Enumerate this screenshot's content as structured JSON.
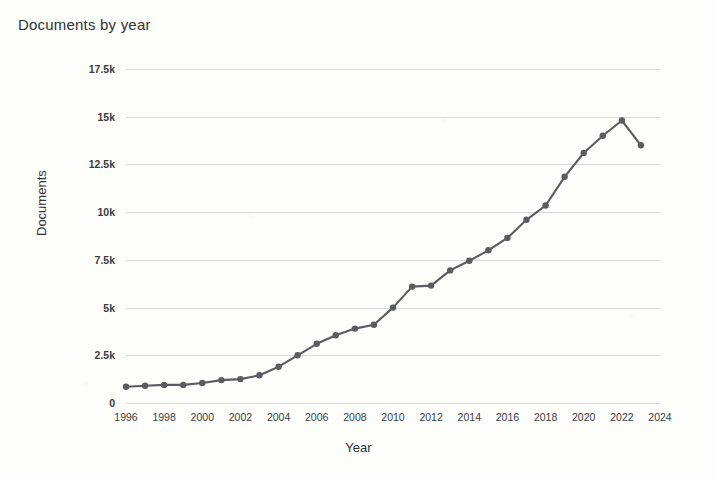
{
  "chart_data": {
    "type": "line",
    "title": "Documents by year",
    "xlabel": "Year",
    "ylabel": "Documents",
    "grid": true,
    "legend": "none",
    "xlim": [
      1996,
      2024
    ],
    "ylim": [
      0,
      17500
    ],
    "ytick_labels": [
      "0",
      "2.5k",
      "5k",
      "7.5k",
      "10k",
      "12.5k",
      "15k",
      "17.5k"
    ],
    "ytick_values": [
      0,
      2500,
      5000,
      7500,
      10000,
      12500,
      15000,
      17500
    ],
    "xtick_labels": [
      "1996",
      "1998",
      "2000",
      "2002",
      "2004",
      "2006",
      "2008",
      "2010",
      "2012",
      "2014",
      "2016",
      "2018",
      "2020",
      "2022",
      "2024"
    ],
    "xtick_values": [
      1996,
      1998,
      2000,
      2002,
      2004,
      2006,
      2008,
      2010,
      2012,
      2014,
      2016,
      2018,
      2020,
      2022,
      2024
    ],
    "series": [
      {
        "name": "Documents",
        "color": "#5a5c60",
        "x": [
          1996,
          1997,
          1998,
          1999,
          2000,
          2001,
          2002,
          2003,
          2004,
          2005,
          2006,
          2007,
          2008,
          2009,
          2010,
          2011,
          2012,
          2013,
          2014,
          2015,
          2016,
          2017,
          2018,
          2019,
          2020,
          2021,
          2022,
          2023
        ],
        "values": [
          850,
          900,
          950,
          950,
          1050,
          1200,
          1250,
          1450,
          1900,
          2500,
          3100,
          3550,
          3900,
          4100,
          5000,
          6100,
          6150,
          6950,
          7450,
          8000,
          8650,
          9600,
          10350,
          11850,
          13100,
          14000,
          14800,
          13500
        ]
      }
    ]
  },
  "axes": {
    "ytitle": "Documents",
    "xtitle": "Year"
  }
}
